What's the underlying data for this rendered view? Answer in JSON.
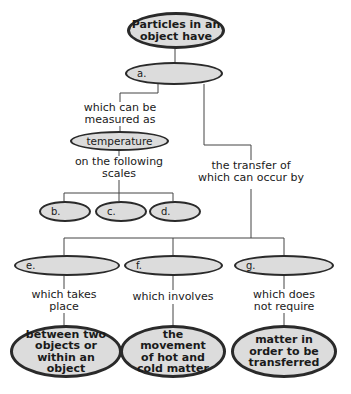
{
  "concept_map": {
    "root": "Particles in an object have",
    "a": "a.",
    "left_link": "which can be measured as",
    "temperature": "temperature",
    "scales_link": "on the following scales",
    "scales": [
      "b.",
      "c.",
      "d."
    ],
    "right_link": "the transfer of which can occur by",
    "transfers": [
      {
        "blank": "e.",
        "link": "which takes place",
        "detail": "between two objects or within an object"
      },
      {
        "blank": "f.",
        "link": "which involves",
        "detail": "the movement of hot and cold matter"
      },
      {
        "blank": "g.",
        "link": "which does not require",
        "detail": "matter in order to be transferred"
      }
    ]
  }
}
